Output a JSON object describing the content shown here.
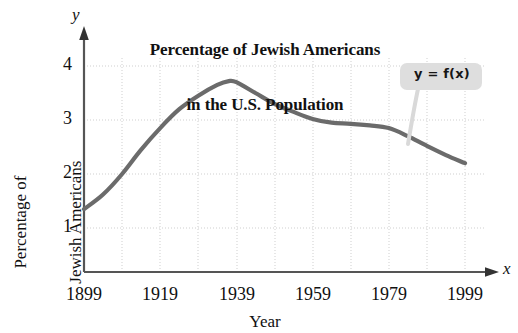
{
  "chart_data": {
    "type": "line",
    "title": "Percentage of Jewish Americans in the U.S. Population",
    "title_lines": [
      "Percentage of Jewish Americans",
      "in the U.S. Population"
    ],
    "xlabel": "Year",
    "ylabel": "Percentage of Jewish Americans",
    "ylabel_lines": [
      "Percentage of",
      "Jewish Americans"
    ],
    "x_axis_variable": "x",
    "y_axis_variable": "y",
    "xlim": [
      1899,
      1999
    ],
    "ylim": [
      0,
      4.35
    ],
    "xticks": [
      1899,
      1919,
      1939,
      1959,
      1979,
      1999
    ],
    "xtick_labels": [
      "1899",
      "1919",
      "1939",
      "1959",
      "1979",
      "1999"
    ],
    "yticks": [
      1,
      2,
      3,
      4
    ],
    "ytick_labels": [
      "1",
      "2",
      "3",
      "4"
    ],
    "grid": true,
    "grid_x_step": 10,
    "grid_y_step": 1,
    "legend": "none",
    "annotation": "y = f(x)",
    "line_color": "#6b6b6b",
    "grid_color": "#cfcfcf",
    "axis_color": "#555555",
    "series": [
      {
        "name": "Percentage of Jewish Americans",
        "x": [
          1899,
          1904,
          1909,
          1914,
          1919,
          1924,
          1929,
          1934,
          1937,
          1939,
          1944,
          1949,
          1954,
          1959,
          1964,
          1969,
          1974,
          1979,
          1984,
          1989,
          1994,
          1999
        ],
        "values": [
          1.35,
          1.62,
          2.0,
          2.45,
          2.85,
          3.2,
          3.45,
          3.65,
          3.72,
          3.7,
          3.5,
          3.3,
          3.15,
          3.02,
          2.95,
          2.93,
          2.9,
          2.85,
          2.7,
          2.52,
          2.35,
          2.2
        ]
      }
    ]
  }
}
